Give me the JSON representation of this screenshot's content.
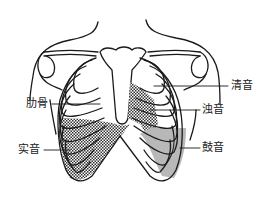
{
  "figure": {
    "labels": {
      "resonance": "清音",
      "dullness": "浊音",
      "tympany": "鼓音",
      "rib": "肋骨",
      "flatness": "实音"
    },
    "rib_numbers": [
      "1",
      "2",
      "3",
      "4",
      "5",
      "6"
    ]
  },
  "colors": {
    "line": "#1a1a1a",
    "tympany_fill": "#b8b8b8",
    "hatch": "#333333",
    "background": "#ffffff"
  }
}
